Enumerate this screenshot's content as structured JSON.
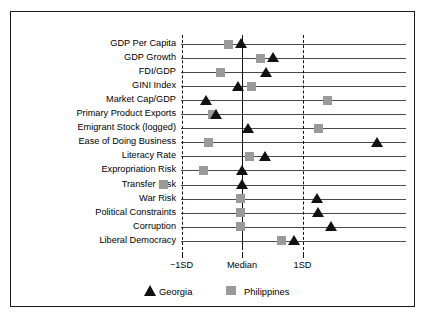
{
  "chart_data": {
    "type": "scatter",
    "title": "",
    "xlabel": "",
    "ylabel": "",
    "orientation": "horizontal",
    "grid": true,
    "legend_position": "bottom",
    "axis_ticks": [
      {
        "label": "−1SD",
        "value": -1
      },
      {
        "label": "Median",
        "value": 0
      },
      {
        "label": "1SD",
        "value": 1
      }
    ],
    "xlim": [
      -2.0,
      2.75
    ],
    "categories": [
      "GDP Per Capita",
      "GDP Growth",
      "FDI/GDP",
      "GINI Index",
      "Market Cap/GDP",
      "Primary Product Exports",
      "Emigrant Stock (logged)",
      "Ease of Doing Business",
      "Literacy Rate",
      "Expropriation Risk",
      "Transfer Risk",
      "War Risk",
      "Political Constraints",
      "Corruption",
      "Liberal Democracy"
    ],
    "series": [
      {
        "name": "Georgia",
        "marker": "triangle",
        "color": "#111111",
        "values": [
          -0.02,
          0.51,
          0.4,
          -0.07,
          -0.6,
          -0.43,
          0.11,
          2.24,
          0.38,
          0.0,
          0.0,
          1.24,
          1.26,
          1.47,
          0.86
        ]
      },
      {
        "name": "Philippines",
        "marker": "square",
        "color": "#9a9a9a",
        "values": [
          -0.22,
          0.31,
          -0.35,
          0.15,
          1.42,
          -0.48,
          1.27,
          -0.55,
          0.12,
          -0.63,
          -1.29,
          -0.02,
          -0.02,
          -0.02,
          0.66
        ]
      }
    ]
  },
  "legend": {
    "items": [
      {
        "label": "Georgia",
        "marker": "triangle"
      },
      {
        "label": "Philippines",
        "marker": "square"
      }
    ]
  }
}
